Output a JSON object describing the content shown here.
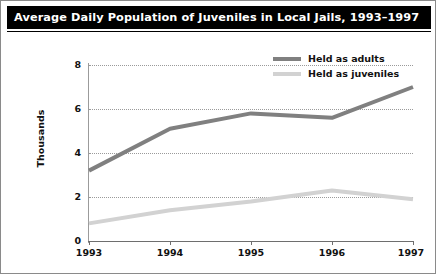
{
  "figure": {
    "title": "Average Daily Population of Juveniles in Local Jails, 1993–1997",
    "border_color": "#8a8a8a",
    "title_bar_color": "#000000",
    "title_text_color": "#ffffff"
  },
  "legend": {
    "position": "top-right",
    "entries": [
      {
        "label": "Held as adults",
        "color": "#808080"
      },
      {
        "label": "Held as juveniles",
        "color": "#d2d2d2"
      }
    ]
  },
  "axes": {
    "y_label": "Thousands",
    "y_ticks": [
      "0",
      "2",
      "4",
      "6",
      "8"
    ],
    "x_ticks": [
      "1993",
      "1994",
      "1995",
      "1996",
      "1997"
    ]
  },
  "chart_data": {
    "type": "line",
    "title": "Average Daily Population of Juveniles in Local Jails, 1993–1997",
    "xlabel": "",
    "ylabel": "Thousands",
    "categories": [
      "1993",
      "1994",
      "1995",
      "1996",
      "1997"
    ],
    "x": [
      1993,
      1994,
      1995,
      1996,
      1997
    ],
    "series": [
      {
        "name": "Held as adults",
        "color": "#808080",
        "values": [
          3.2,
          5.1,
          5.8,
          5.6,
          7.0
        ]
      },
      {
        "name": "Held as juveniles",
        "color": "#d2d2d2",
        "values": [
          0.8,
          1.4,
          1.8,
          2.3,
          1.9
        ]
      }
    ],
    "ylim": [
      0,
      8
    ],
    "yticks": [
      0,
      2,
      4,
      6,
      8
    ],
    "grid": "horizontal-dotted",
    "legend_position": "top-right"
  }
}
